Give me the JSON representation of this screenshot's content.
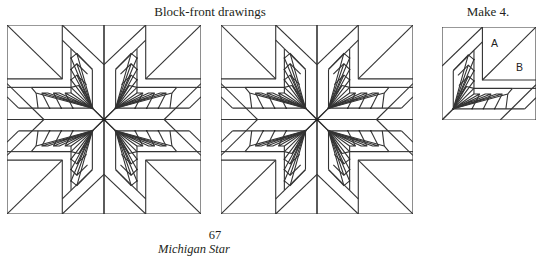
{
  "page": {
    "heading_left": "Block-front drawings",
    "heading_right": "Make 4.",
    "page_number": "67",
    "caption": "Michigan Star"
  },
  "figures": [
    {
      "id": "block-1",
      "type": "full-block",
      "quadrants": 4
    },
    {
      "id": "block-2",
      "type": "full-block",
      "quadrants": 4
    },
    {
      "id": "unit",
      "type": "quarter-unit",
      "make_count": 4,
      "piece_labels": [
        "A",
        "B"
      ]
    }
  ],
  "unit": {
    "piece_a_label": "A",
    "piece_b_label": "B"
  },
  "colors": {
    "line": "#333333",
    "background": "#ffffff",
    "text": "#231f20"
  }
}
